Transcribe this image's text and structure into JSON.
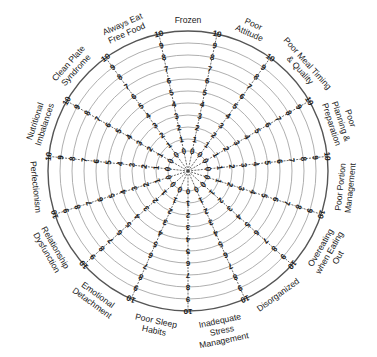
{
  "diagram": {
    "type": "wheel",
    "center": [
      188,
      171
    ],
    "outer_radius": 140,
    "scale": {
      "min": 0,
      "max": 10,
      "step": 1
    },
    "spoke_offset_deg": -12,
    "categories": [
      {
        "lines": [
          "Frozen"
        ]
      },
      {
        "lines": [
          "Poor",
          "Attitude"
        ]
      },
      {
        "lines": [
          "Poor Meal Timing",
          "& Quality"
        ]
      },
      {
        "lines": [
          "Poor",
          "Planning &",
          "Preparation"
        ]
      },
      {
        "lines": [
          "Poor Portion",
          "Management"
        ]
      },
      {
        "lines": [
          "Overeating",
          "when Eating",
          "Out"
        ]
      },
      {
        "lines": [
          "Disorganized"
        ]
      },
      {
        "lines": [
          "Inadequate",
          "Stress",
          "Management"
        ]
      },
      {
        "lines": [
          "Poor Sleep",
          "Habits"
        ]
      },
      {
        "lines": [
          "Emotional",
          "Detachment"
        ]
      },
      {
        "lines": [
          "Relationship",
          "Dysfunction"
        ]
      },
      {
        "lines": [
          "Perfectionism"
        ]
      },
      {
        "lines": [
          "Nutritional",
          "Imbalances"
        ]
      },
      {
        "lines": [
          "Clean Plate",
          "Syndrome"
        ]
      },
      {
        "lines": [
          "Always Eat",
          "Free Food"
        ]
      }
    ],
    "tick_labels": [
      "0",
      "1",
      "2",
      "3",
      "4",
      "5",
      "6",
      "7",
      "8",
      "9",
      "10"
    ],
    "colors": {
      "ring": "#9a9a9a",
      "outer_ring": "#555555",
      "spoke": "#444444",
      "text": "#222222"
    }
  }
}
